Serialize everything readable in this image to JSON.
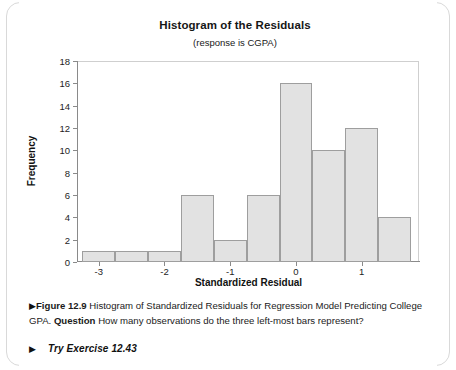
{
  "figure": {
    "marker": "▶",
    "label": "Figure 12.9",
    "caption_main": " Histogram of Standardized Residuals for Regression Model Predicting College GPA. ",
    "question_label": "Question",
    "question_text": " How many observations do the three left-most bars represent?",
    "try_marker": "▶",
    "try_text": "Try Exercise 12.43"
  },
  "chart_data": {
    "type": "bar",
    "title": "Histogram of the Residuals",
    "subtitle": "(response is CGPA)",
    "xlabel": "Standardized Residual",
    "ylabel": "Frequency",
    "xlim": [
      -3.33,
      1.87
    ],
    "ylim": [
      0,
      18
    ],
    "xticks": [
      -3,
      -2,
      -1,
      0,
      1
    ],
    "xtick_labels": [
      "-3",
      "-2",
      "-1",
      "0",
      "1"
    ],
    "yticks": [
      0,
      2,
      4,
      6,
      8,
      10,
      12,
      14,
      16,
      18
    ],
    "ytick_labels": [
      "0",
      "2",
      "4",
      "6",
      "8",
      "10",
      "12",
      "14",
      "16",
      "18"
    ],
    "grid": false,
    "legend": false,
    "bin_width": 0.5,
    "bin_left_edges": [
      -3.25,
      -2.75,
      -2.25,
      -1.75,
      -1.25,
      -0.75,
      -0.25,
      0.25,
      0.75,
      1.25
    ],
    "bin_centers": [
      -3.0,
      -2.5,
      -2.0,
      -1.5,
      -1.0,
      -0.5,
      0.0,
      0.5,
      1.0,
      1.5
    ],
    "values": [
      1,
      1,
      1,
      6,
      2,
      6,
      16,
      10,
      12,
      4
    ],
    "bar_fill": "#e2e2e2",
    "bar_edge": "#9e9e9e"
  }
}
